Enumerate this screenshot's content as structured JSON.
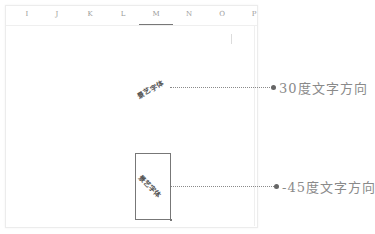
{
  "spreadsheet": {
    "columns": [
      {
        "label": "I",
        "selected": false
      },
      {
        "label": "J",
        "selected": false
      },
      {
        "label": "K",
        "selected": false
      },
      {
        "label": "L",
        "selected": false
      },
      {
        "label": "M",
        "selected": true
      },
      {
        "label": "N",
        "selected": false
      },
      {
        "label": "O",
        "selected": false
      },
      {
        "label": "P",
        "selected": false
      }
    ],
    "rotated_cells": [
      {
        "text": "景艺字体",
        "angle_deg": -30
      },
      {
        "text": "景艺字体",
        "angle_deg": 45,
        "boxed": true
      }
    ]
  },
  "callouts": [
    {
      "label": "30度文字方向"
    },
    {
      "label": "-45度文字方向"
    }
  ],
  "colors": {
    "grid": "#ececec",
    "leader": "#8a8a8a",
    "label": "#8a8a8a",
    "box_border": "#777777"
  }
}
